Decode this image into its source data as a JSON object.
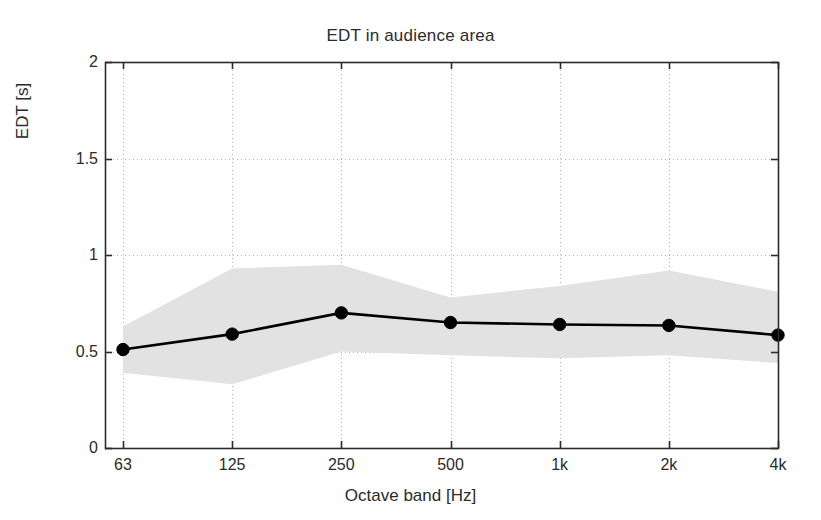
{
  "chart_data": {
    "type": "line",
    "title": "EDT in audience area",
    "xlabel": "Octave band [Hz]",
    "ylabel": "EDT [s]",
    "categories": [
      "63",
      "125",
      "250",
      "500",
      "1k",
      "2k",
      "4k"
    ],
    "values": [
      0.51,
      0.59,
      0.7,
      0.65,
      0.64,
      0.635,
      0.585
    ],
    "band_upper": [
      0.63,
      0.93,
      0.95,
      0.78,
      0.84,
      0.92,
      0.81
    ],
    "band_lower": [
      0.39,
      0.33,
      0.5,
      0.48,
      0.465,
      0.48,
      0.44
    ],
    "series": [
      {
        "name": "EDT mean",
        "values": [
          0.51,
          0.59,
          0.7,
          0.65,
          0.64,
          0.635,
          0.585
        ],
        "marker": "filled-circle",
        "color": "#000000"
      },
      {
        "name": "EDT spread band",
        "upper": [
          0.63,
          0.93,
          0.95,
          0.78,
          0.84,
          0.92,
          0.81
        ],
        "lower": [
          0.39,
          0.33,
          0.5,
          0.48,
          0.465,
          0.48,
          0.44
        ],
        "color": "#e2e2e2"
      }
    ],
    "ylim": [
      0,
      2
    ],
    "yticks": [
      0,
      0.5,
      1,
      1.5,
      2
    ],
    "ytick_labels": [
      "0",
      "0.5",
      "1",
      "1.5",
      "2"
    ],
    "xtick_labels": [
      "63",
      "125",
      "250",
      "500",
      "1k",
      "2k",
      "4k"
    ],
    "grid": true,
    "grid_style": "dotted",
    "legend": "none",
    "colors": {
      "line": "#000000",
      "marker": "#000000",
      "band": "#e2e2e2",
      "axis": "#2b2b2b",
      "grid": "#b4b4b4",
      "background": "#ffffff"
    }
  }
}
